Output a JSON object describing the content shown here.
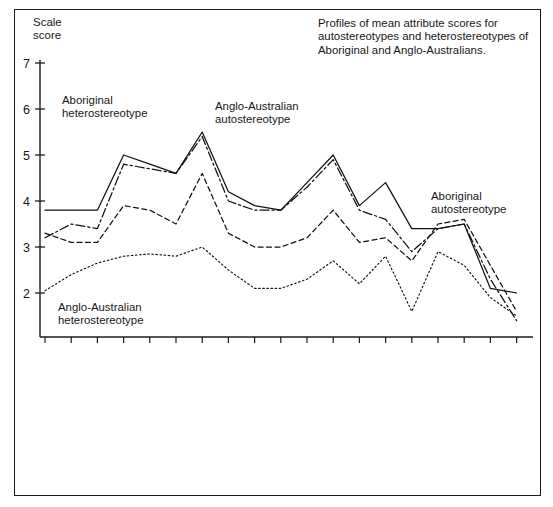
{
  "caption": "Profiles of mean attribute scores for autostereotypes and heterostereotypes of Aboriginal and Anglo-Australians.",
  "axis_title": "Scale\nscore",
  "annotations": [
    {
      "id": "aboriginal-heterostereotype",
      "text": "Aboriginal\nheterostereotype"
    },
    {
      "id": "anglo-australian-heterostereotype",
      "text": "Anglo-Australian\nheterostereotype"
    },
    {
      "id": "anglo-australian-autostereotype",
      "text": "Anglo-Australian\nautostereotype"
    },
    {
      "id": "aboriginal-autostereotype",
      "text": "Aboriginal\nautostereotype"
    }
  ],
  "chart_data": {
    "type": "line",
    "title": "Profiles of mean attribute scores for autostereotypes and heterostereotypes of Aboriginal and Anglo-Australians.",
    "xlabel": "",
    "ylabel": "Scale score",
    "ylim": [
      1,
      7
    ],
    "yticks": [
      2,
      3,
      4,
      5,
      6,
      7
    ],
    "grid": false,
    "legend": "annotations",
    "categories": [
      "Trustworthy",
      "Concern for occupational status",
      "Strong sense of right and wrong",
      "Good parents",
      "Definite purpose in life",
      "Good providers",
      "Take care of their possessions",
      "Friendly",
      "Non-aggressive",
      "Law-abiding",
      "Careful with money",
      "Motivated",
      "Clean and tidy",
      "Reliable",
      "Even-tempered",
      "Other things more important than money",
      "Speak good English",
      "Concerned for others' needs",
      "Know when to stop drinking alcohol"
    ],
    "series": [
      {
        "name": "Anglo-Australian autostereotype",
        "style": "solid",
        "values": [
          3.8,
          3.8,
          3.8,
          5.0,
          4.8,
          4.6,
          5.5,
          4.2,
          3.9,
          3.8,
          4.4,
          5.0,
          3.9,
          4.4,
          3.4,
          3.4,
          3.5,
          2.1,
          2.0
        ]
      },
      {
        "name": "Anglo-Australian heterostereotype",
        "style": "dashdot",
        "values": [
          3.2,
          3.5,
          3.4,
          4.8,
          4.7,
          4.6,
          5.4,
          4.0,
          3.8,
          3.8,
          4.3,
          4.9,
          3.8,
          3.6,
          2.9,
          3.4,
          3.5,
          2.3,
          1.4
        ]
      },
      {
        "name": "Aboriginal heterostereotype",
        "style": "dashed",
        "values": [
          3.3,
          3.1,
          3.1,
          3.9,
          3.8,
          3.5,
          4.6,
          3.3,
          3.0,
          3.0,
          3.2,
          3.8,
          3.1,
          3.2,
          2.7,
          3.5,
          3.6,
          2.6,
          1.6
        ]
      },
      {
        "name": "Aboriginal autostereotype",
        "style": "dotted",
        "values": [
          2.05,
          2.4,
          2.65,
          2.8,
          2.85,
          2.8,
          3.0,
          2.5,
          2.1,
          2.1,
          2.3,
          2.7,
          2.2,
          2.8,
          1.6,
          2.9,
          2.6,
          1.9,
          1.5
        ]
      }
    ]
  },
  "axis": {
    "y_tick_labels": [
      "7",
      "6",
      "5",
      "4",
      "3",
      "2"
    ]
  }
}
